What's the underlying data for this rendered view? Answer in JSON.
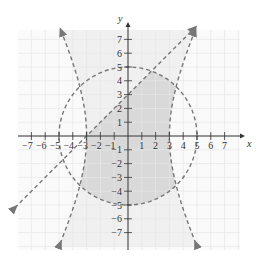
{
  "chart_data": {
    "type": "region",
    "title": "",
    "xlabel": "x",
    "ylabel": "y",
    "xlim": [
      -8,
      8
    ],
    "ylim": [
      -8,
      8
    ],
    "grid": true,
    "x_ticks": [
      -7,
      -6,
      -5,
      -4,
      -3,
      -2,
      -1,
      1,
      2,
      3,
      4,
      5,
      6,
      7
    ],
    "y_ticks": [
      -7,
      -6,
      -5,
      -4,
      -3,
      -2,
      -1,
      1,
      2,
      3,
      4,
      5,
      6,
      7
    ],
    "x_tick_labels": [
      "−7",
      "−6",
      "−5",
      "−4",
      "−3",
      "−2",
      "−1",
      "1",
      "2",
      "3",
      "4",
      "5",
      "6",
      "7"
    ],
    "y_tick_labels": [
      "−7",
      "−6",
      "−5",
      "−4",
      "−3",
      "−2",
      "−1",
      "1",
      "2",
      "3",
      "4",
      "5",
      "6",
      "7"
    ],
    "curves": [
      {
        "name": "circle",
        "equation": "x^2 + y^2 = 25",
        "style": "dashed",
        "center": [
          0,
          0
        ],
        "radius": 5
      },
      {
        "name": "hyperbola",
        "equation": "x^2/9 - y^2/36 = 1",
        "style": "dashed",
        "vertices": [
          [
            -3,
            0
          ],
          [
            3,
            0
          ]
        ]
      },
      {
        "name": "line",
        "equation": "y = x + 3",
        "style": "dashed",
        "points": [
          [
            -3,
            0
          ],
          [
            0,
            3
          ]
        ]
      }
    ],
    "shaded_regions": [
      {
        "name": "between-hyperbola-branches",
        "shade": "light"
      },
      {
        "name": "inside-circle-between-branches-below-line",
        "shade": "dark"
      }
    ]
  },
  "colors": {
    "grid": "#e6e6e6",
    "light_shade": "#f0f0f0",
    "dark_shade": "#d9d9d9",
    "curve": "#777777",
    "axis": "#333333"
  }
}
